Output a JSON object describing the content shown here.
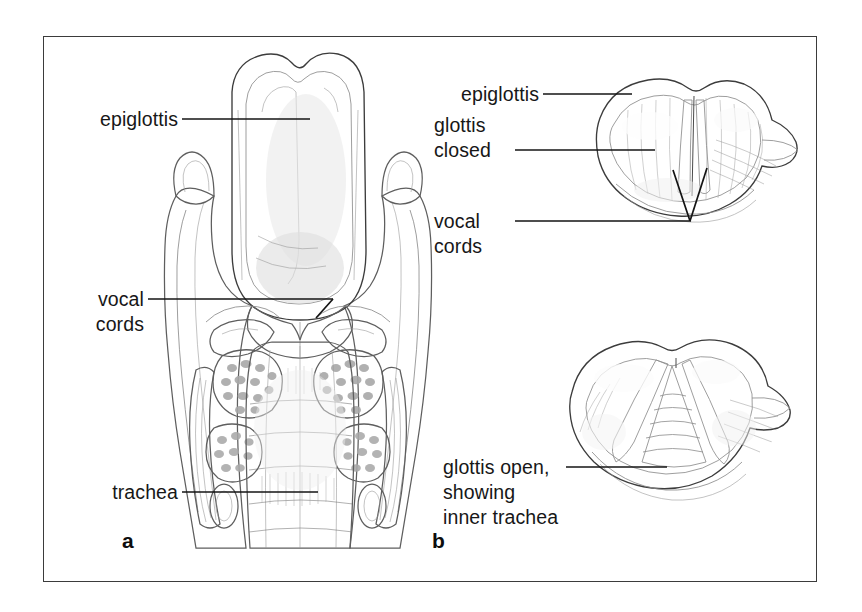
{
  "figure": {
    "background_color": "#ffffff",
    "frame_color": "#3b3b3b",
    "ink_color": "#141414"
  },
  "panels": [
    {
      "id": "a",
      "letter": "a",
      "caption": "Coronal section of the larynx showing the epiglottis, vocal cords and trachea",
      "labels": [
        {
          "id": "epiglottis-a",
          "text": "epiglottis",
          "lines": [
            "epiglottis"
          ]
        },
        {
          "id": "vocal-cords-a",
          "text": "vocal cords",
          "lines": [
            "vocal",
            "cords"
          ]
        },
        {
          "id": "trachea-a",
          "text": "trachea",
          "lines": [
            "trachea"
          ]
        }
      ]
    },
    {
      "id": "b",
      "letter": "b",
      "caption": "Superior laryngoscopic views of the glottis, closed and open",
      "labels": [
        {
          "id": "epiglottis-b",
          "text": "epiglottis",
          "lines": [
            "epiglottis"
          ]
        },
        {
          "id": "glottis-closed",
          "text": "glottis closed",
          "lines": [
            "glottis",
            "closed"
          ]
        },
        {
          "id": "vocal-cords-b",
          "text": "vocal cords",
          "lines": [
            "vocal",
            "cords"
          ]
        },
        {
          "id": "glottis-open",
          "text": "glottis open, showing inner trachea",
          "lines": [
            "glottis open,",
            "showing",
            "inner trachea"
          ]
        }
      ]
    }
  ],
  "label_text": {
    "epiglottis_a": "epiglottis",
    "vocal_a_line1": "vocal",
    "vocal_a_line2": "cords",
    "trachea_a": "trachea",
    "epiglottis_b": "epiglottis",
    "glottis_b_line1": "glottis",
    "glottis_b_line2": "closed",
    "vocal_b_line1": "vocal",
    "vocal_b_line2": "cords",
    "open_b_line1": "glottis open,",
    "open_b_line2": "showing",
    "open_b_line3": "inner trachea",
    "letter_a": "a",
    "letter_b": "b"
  },
  "palette": {
    "ink": "#141414",
    "frame": "#3b3b3b",
    "outline_mid": "#5e5e5e",
    "outline_light": "#8c8c8c",
    "tissue_light": "#f2f2f2",
    "tissue_mid": "#d9d9d9",
    "tissue_dark": "#b4b4b4",
    "cartilage": "#e6e6e6",
    "shadow": "#9a9a9a"
  }
}
